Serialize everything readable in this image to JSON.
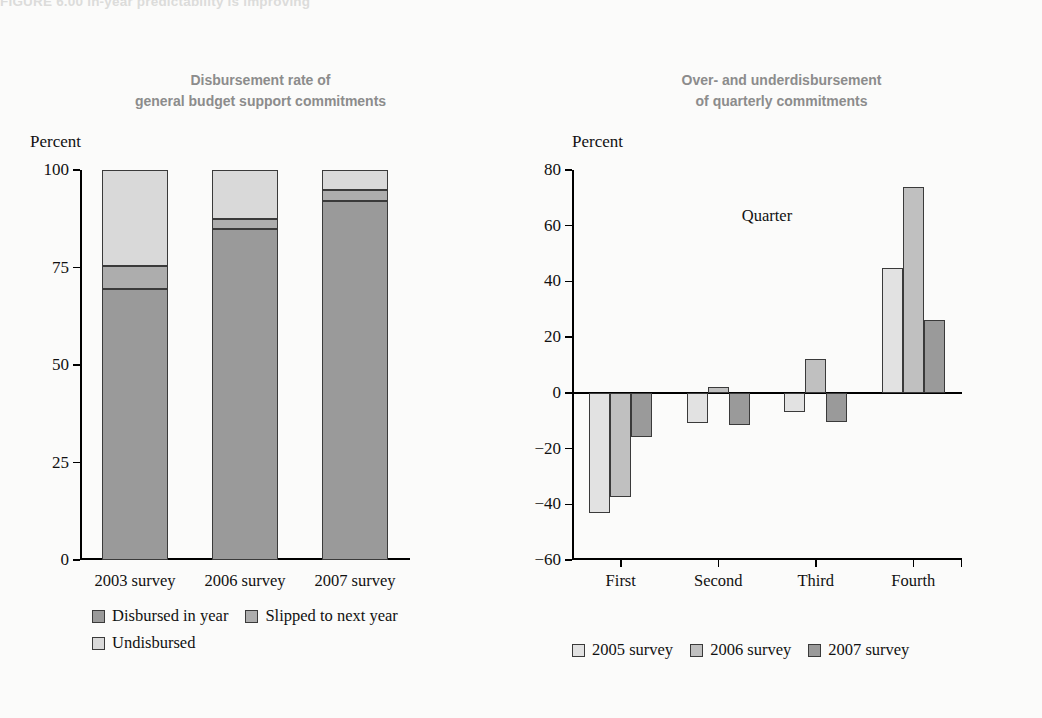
{
  "figure": {
    "caption": "FIGURE 6.00   In-year predictability is improving"
  },
  "colors": {
    "dark_gray": "#9a9a9a",
    "mid_gray": "#adadad",
    "light_gray": "#d9d9d9",
    "lightest_gray": "#e2e2e2",
    "outline": "#3a3a3a",
    "title_gray": "#8c8c8c",
    "axis_black": "#000000",
    "background": "#fbfbfa"
  },
  "left_panel": {
    "title_line1": "Disbursement rate of",
    "title_line2": "general budget support commitments",
    "y_axis_unit": "Percent",
    "legend": [
      {
        "label": "Disbursed in year",
        "color": "#9a9a9a"
      },
      {
        "label": "Slipped to next year",
        "color": "#adadad"
      },
      {
        "label": "Undisbursed",
        "color": "#d9d9d9"
      }
    ]
  },
  "right_panel": {
    "title_line1": "Over- and underdisbursement",
    "title_line2": "of quarterly commitments",
    "y_axis_unit": "Percent",
    "x_axis_title": "Quarter",
    "legend": [
      {
        "label": "2005 survey",
        "color": "#e2e2e2"
      },
      {
        "label": "2006 survey",
        "color": "#c0c0c0"
      },
      {
        "label": "2007 survey",
        "color": "#9a9a9a"
      }
    ]
  },
  "chart_data": [
    {
      "type": "bar",
      "id": "disbursement-rate",
      "stacked": true,
      "title": "Disbursement rate of general budget support commitments",
      "xlabel": "",
      "ylabel": "Percent",
      "ylim": [
        0,
        100
      ],
      "yticks": [
        0,
        25,
        50,
        75,
        100
      ],
      "ytick_labels": [
        "0",
        "25",
        "50",
        "75",
        "100"
      ],
      "grid": false,
      "legend_position": "below",
      "categories": [
        "2003 survey",
        "2006 survey",
        "2007 survey"
      ],
      "series": [
        {
          "name": "Disbursed in year",
          "values": [
            69.5,
            85.0,
            92.0
          ],
          "color": "#9a9a9a"
        },
        {
          "name": "Slipped to next year",
          "values": [
            6.0,
            2.5,
            3.0
          ],
          "color": "#adadad"
        },
        {
          "name": "Undisbursed",
          "values": [
            24.5,
            12.5,
            5.0
          ],
          "color": "#d9d9d9"
        }
      ]
    },
    {
      "type": "bar",
      "id": "over-underdisbursement",
      "stacked": false,
      "title": "Over- and underdisbursement of quarterly commitments",
      "xlabel": "Quarter",
      "ylabel": "Percent",
      "ylim": [
        -60,
        80
      ],
      "yticks": [
        -60,
        -40,
        -20,
        0,
        20,
        40,
        60,
        80
      ],
      "ytick_labels": [
        "−60",
        "−40",
        "−20",
        "0",
        "20",
        "40",
        "60",
        "80"
      ],
      "grid": false,
      "legend_position": "below",
      "categories": [
        "First",
        "Second",
        "Third",
        "Fourth"
      ],
      "series": [
        {
          "name": "2005 survey",
          "values": [
            -43.0,
            -11.0,
            -7.0,
            45.0
          ],
          "color": "#e2e2e2"
        },
        {
          "name": "2006 survey",
          "values": [
            -37.5,
            2.0,
            12.0,
            74.0
          ],
          "color": "#c0c0c0"
        },
        {
          "name": "2007 survey",
          "values": [
            -16.0,
            -11.5,
            -10.5,
            26.0
          ],
          "color": "#9a9a9a"
        }
      ]
    }
  ]
}
